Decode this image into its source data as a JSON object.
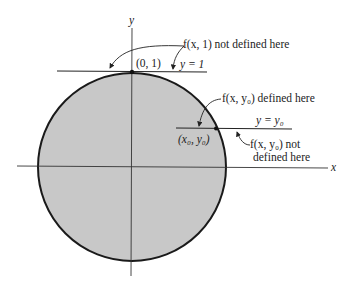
{
  "figure": {
    "type": "diagram",
    "axes": {
      "x_label": "x",
      "y_label": "y"
    },
    "labels": {
      "point_top": "(0, 1)",
      "line_top": "y = 1",
      "annot_top": "f(x, 1) not defined here",
      "annot_defined": "f(x, y₀) defined here",
      "line_y0": "y = y₀",
      "point_x0y0": "(x₀, y₀)",
      "annot_not_defined_1": "f(x, y₀) not",
      "annot_not_defined_2": "defined here"
    },
    "colors": {
      "disk_fill": "#c8c8c8",
      "stroke": "#1a1a1a",
      "background": "#ffffff"
    }
  }
}
